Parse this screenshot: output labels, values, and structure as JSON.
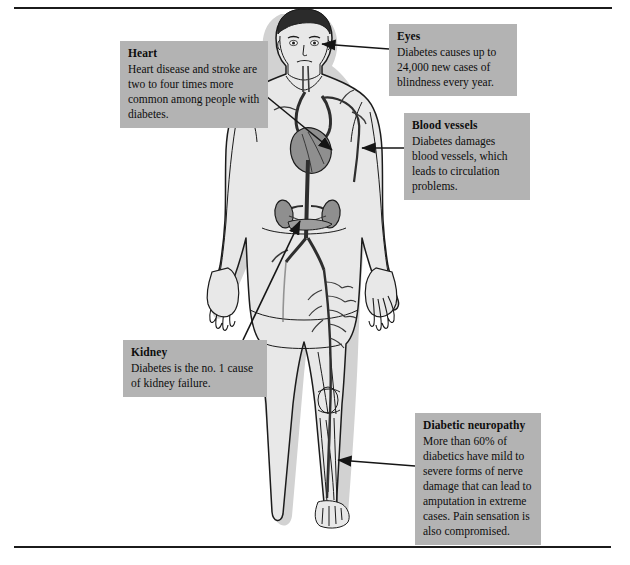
{
  "diagram": {
    "colors": {
      "callout_background": "#b3b3b3",
      "callout_text": "#0d0d0d",
      "body_fill": "#e8e8e8",
      "body_shadow": "#d2d2d2",
      "outline": "#1b1b1b",
      "vessel": "#3a3a3a",
      "organ": "#8f8f8f",
      "hair": "#2b2b2b",
      "page_background": "#ffffff",
      "rule": "#1b1b1b"
    }
  },
  "callouts": [
    {
      "id": "heart",
      "title": "Heart",
      "body": "Heart disease and stroke are two to four times more common among people with diabetes."
    },
    {
      "id": "eyes",
      "title": "Eyes",
      "body": "Diabetes causes up to 24,000 new cases of blindness every year."
    },
    {
      "id": "blood-vessels",
      "title": "Blood vessels",
      "body": "Diabetes damages blood vessels, which leads to circulation problems."
    },
    {
      "id": "kidney",
      "title": "Kidney",
      "body": "Diabetes is the no. 1 cause of kidney failure."
    },
    {
      "id": "diabetic-neuropathy",
      "title": "Diabetic neuropathy",
      "body": "More than 60% of diabetics have mild to severe forms of nerve damage that can lead to amputation in extreme cases. Pain sensation is also compromised."
    }
  ]
}
